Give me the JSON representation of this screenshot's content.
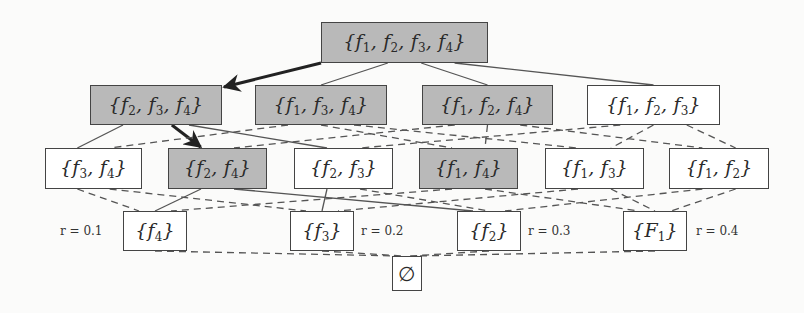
{
  "diagram": {
    "type": "subset-lattice",
    "colors": {
      "highlight_fill": "#b9b9b9",
      "normal_fill": "#ffffff",
      "border": "#444444",
      "edge": "#444444",
      "arrow": "#222222"
    },
    "nodes": [
      {
        "id": "f1f2f3f4",
        "label": "{f1, f2, f3, f4}",
        "highlighted": true,
        "x": 321,
        "y": 22,
        "w": 167,
        "h": 41
      },
      {
        "id": "f2f3f4",
        "label": "{f2, f3, f4}",
        "highlighted": true,
        "x": 90,
        "y": 85,
        "w": 132,
        "h": 40
      },
      {
        "id": "f1f3f4",
        "label": "{f1, f3, f4}",
        "highlighted": true,
        "x": 255,
        "y": 85,
        "w": 132,
        "h": 40
      },
      {
        "id": "f1f2f4",
        "label": "{f1, f2, f4}",
        "highlighted": true,
        "x": 422,
        "y": 85,
        "w": 131,
        "h": 40
      },
      {
        "id": "f1f2f3",
        "label": "{f1, f2, f3}",
        "highlighted": false,
        "x": 587,
        "y": 85,
        "w": 133,
        "h": 40
      },
      {
        "id": "f3f4",
        "label": "{f3, f4}",
        "highlighted": false,
        "x": 45,
        "y": 148,
        "w": 97,
        "h": 41
      },
      {
        "id": "f2f4",
        "label": "{f2, f4}",
        "highlighted": true,
        "x": 168,
        "y": 148,
        "w": 99,
        "h": 41
      },
      {
        "id": "f2f3",
        "label": "{f2, f3}",
        "highlighted": false,
        "x": 294,
        "y": 148,
        "w": 99,
        "h": 41
      },
      {
        "id": "f1f4",
        "label": "{f1, f4}",
        "highlighted": true,
        "x": 419,
        "y": 148,
        "w": 99,
        "h": 41
      },
      {
        "id": "f1f3",
        "label": "{f1, f3}",
        "highlighted": false,
        "x": 545,
        "y": 148,
        "w": 99,
        "h": 41
      },
      {
        "id": "f1f2",
        "label": "{f1, f2}",
        "highlighted": false,
        "x": 669,
        "y": 148,
        "w": 100,
        "h": 41
      },
      {
        "id": "f4",
        "label": "{f4}",
        "highlighted": false,
        "x": 123,
        "y": 211,
        "w": 64,
        "h": 40
      },
      {
        "id": "f3",
        "label": "{f3}",
        "highlighted": false,
        "x": 290,
        "y": 211,
        "w": 64,
        "h": 40
      },
      {
        "id": "f2",
        "label": "{f2}",
        "highlighted": false,
        "x": 457,
        "y": 211,
        "w": 64,
        "h": 40
      },
      {
        "id": "F1",
        "label": "{F1}",
        "highlighted": false,
        "x": 623,
        "y": 211,
        "w": 64,
        "h": 40
      },
      {
        "id": "empty",
        "label": "∅",
        "highlighted": false,
        "x": 392,
        "y": 256,
        "w": 30,
        "h": 35
      }
    ],
    "r_labels": [
      {
        "text": "r = 0.1",
        "x": 60,
        "y": 224
      },
      {
        "text": "r = 0.2",
        "x": 361,
        "y": 224
      },
      {
        "text": "r = 0.3",
        "x": 528,
        "y": 224
      },
      {
        "text": "r = 0.4",
        "x": 696,
        "y": 224
      }
    ],
    "edges": [
      {
        "from": "f1f2f3f4",
        "to": "f2f3f4",
        "style": "arrow"
      },
      {
        "from": "f1f2f3f4",
        "to": "f1f3f4",
        "style": "solid"
      },
      {
        "from": "f1f2f3f4",
        "to": "f1f2f4",
        "style": "solid"
      },
      {
        "from": "f1f2f3f4",
        "to": "f1f2f3",
        "style": "solid"
      },
      {
        "from": "f2f3f4",
        "to": "f3f4",
        "style": "solid"
      },
      {
        "from": "f2f3f4",
        "to": "f2f4",
        "style": "arrow"
      },
      {
        "from": "f2f3f4",
        "to": "f2f3",
        "style": "solid"
      },
      {
        "from": "f1f3f4",
        "to": "f3f4",
        "style": "dashed"
      },
      {
        "from": "f1f3f4",
        "to": "f1f4",
        "style": "dashed"
      },
      {
        "from": "f1f3f4",
        "to": "f1f3",
        "style": "dashed"
      },
      {
        "from": "f1f2f4",
        "to": "f2f4",
        "style": "dashed"
      },
      {
        "from": "f1f2f4",
        "to": "f1f4",
        "style": "dashed"
      },
      {
        "from": "f1f2f4",
        "to": "f1f2",
        "style": "dashed"
      },
      {
        "from": "f1f2f3",
        "to": "f2f3",
        "style": "dashed"
      },
      {
        "from": "f1f2f3",
        "to": "f1f3",
        "style": "dashed"
      },
      {
        "from": "f1f2f3",
        "to": "f1f2",
        "style": "dashed"
      },
      {
        "from": "f3f4",
        "to": "f4",
        "style": "dashed"
      },
      {
        "from": "f3f4",
        "to": "f3",
        "style": "dashed"
      },
      {
        "from": "f2f4",
        "to": "f4",
        "style": "solid"
      },
      {
        "from": "f2f4",
        "to": "f2",
        "style": "solid"
      },
      {
        "from": "f2f3",
        "to": "f3",
        "style": "solid"
      },
      {
        "from": "f2f3",
        "to": "f2",
        "style": "dashed"
      },
      {
        "from": "f1f4",
        "to": "f4",
        "style": "dashed"
      },
      {
        "from": "f1f4",
        "to": "F1",
        "style": "dashed"
      },
      {
        "from": "f1f3",
        "to": "f3",
        "style": "dashed"
      },
      {
        "from": "f1f3",
        "to": "F1",
        "style": "dashed"
      },
      {
        "from": "f1f2",
        "to": "f2",
        "style": "dashed"
      },
      {
        "from": "f1f2",
        "to": "F1",
        "style": "dashed"
      },
      {
        "from": "f4",
        "to": "empty",
        "style": "dashed"
      },
      {
        "from": "f3",
        "to": "empty",
        "style": "dashed"
      },
      {
        "from": "f2",
        "to": "empty",
        "style": "dashed"
      },
      {
        "from": "F1",
        "to": "empty",
        "style": "dashed"
      }
    ]
  }
}
